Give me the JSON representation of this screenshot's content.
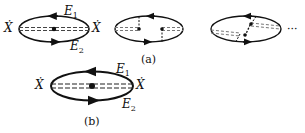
{
  "diagrams": {
    "a1": {
      "left_label": "Ẋ",
      "right_label": "Ẋ",
      "top_label": "E",
      "top_sub": "1",
      "bottom_label": "E",
      "bottom_sub": "2"
    },
    "a2": {},
    "a3": {
      "ellipsis": "···"
    },
    "caption_a": "(a)",
    "b": {
      "left_label": "Ẋ",
      "right_label": "Ẋ",
      "top_label": "E",
      "top_sub": "1",
      "bottom_label": "E",
      "bottom_sub": "2"
    },
    "caption_b": "(b)"
  },
  "colors": {
    "ink": "#111111",
    "dashed": "#444444",
    "background": "#ffffff"
  }
}
